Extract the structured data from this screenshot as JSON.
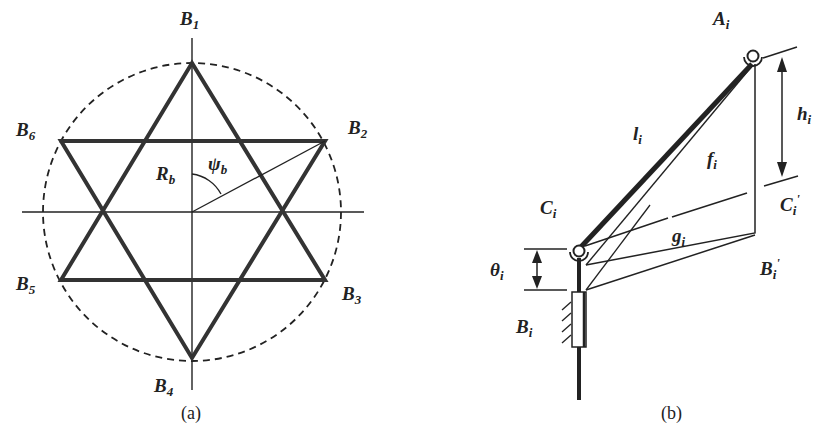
{
  "figure_a": {
    "caption": "(a)",
    "vertices": [
      {
        "name": "B",
        "sub": "1"
      },
      {
        "name": "B",
        "sub": "2"
      },
      {
        "name": "B",
        "sub": "3"
      },
      {
        "name": "B",
        "sub": "4"
      },
      {
        "name": "B",
        "sub": "5"
      },
      {
        "name": "B",
        "sub": "6"
      }
    ],
    "radius_label": {
      "name": "R",
      "sub": "b"
    },
    "angle_label": {
      "name": "ψ",
      "sub": "b"
    }
  },
  "figure_b": {
    "caption": "(b)",
    "labels": {
      "A": {
        "name": "A",
        "sub": "i"
      },
      "h": {
        "name": "h",
        "sub": "i"
      },
      "l": {
        "name": "l",
        "sub": "i"
      },
      "f": {
        "name": "f",
        "sub": "i"
      },
      "C": {
        "name": "C",
        "sub": "i"
      },
      "C_prime": {
        "name": "C",
        "sub": "i",
        "prime": "'"
      },
      "g": {
        "name": "g",
        "sub": "i"
      },
      "theta": {
        "name": "θ",
        "sub": "i"
      },
      "B_prime": {
        "name": "B",
        "sub": "i",
        "prime": "'"
      },
      "B": {
        "name": "B",
        "sub": "i"
      }
    }
  }
}
